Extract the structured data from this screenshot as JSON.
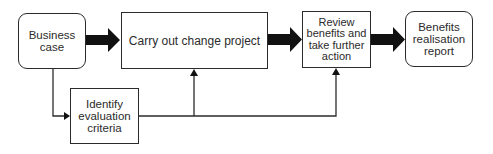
{
  "diagram": {
    "type": "flowchart",
    "nodes": [
      {
        "id": "business_case",
        "label": "Business\ncase",
        "shape": "rounded-rectangle"
      },
      {
        "id": "carry_out",
        "label": "Carry out change project",
        "shape": "rectangle"
      },
      {
        "id": "review",
        "label": "Review\nbenefits and\ntake further\naction",
        "shape": "rectangle"
      },
      {
        "id": "benefits_report",
        "label": "Benefits\nrealisation\nreport",
        "shape": "rounded-rectangle"
      },
      {
        "id": "identify",
        "label": "Identify\nevaluation\ncriteria",
        "shape": "rectangle"
      }
    ],
    "edges": [
      {
        "from": "business_case",
        "to": "carry_out",
        "style": "thick-block-arrow"
      },
      {
        "from": "carry_out",
        "to": "review",
        "style": "thick-block-arrow"
      },
      {
        "from": "review",
        "to": "benefits_report",
        "style": "thick-block-arrow"
      },
      {
        "from": "business_case",
        "to": "identify",
        "style": "thin-elbow-arrow"
      },
      {
        "from": "identify",
        "to": "carry_out",
        "style": "thin-elbow-arrow"
      },
      {
        "from": "identify",
        "to": "review",
        "style": "thin-elbow-arrow"
      }
    ],
    "colors": {
      "stroke": "#2b2b2b",
      "fill": "#ffffff",
      "arrow": "#111111"
    }
  }
}
